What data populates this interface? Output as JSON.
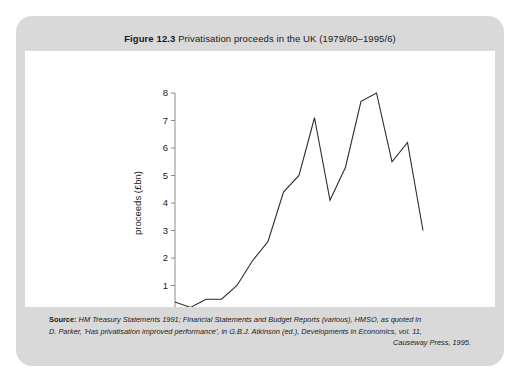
{
  "figure": {
    "label": "Figure 12.3",
    "title": "Privatisation proceeds in the UK (1979/80–1995/6)"
  },
  "caption": {
    "source_label": "Source:",
    "line1": "HM Treasury Statements 1991; Financial Statements and Budget Reports (various), HMSO, as quoted in",
    "line2": "D. Parker, 'Has privatisation improved performance', in G.B.J. Atkinson (ed.), Developments in Economics, vol. 11,",
    "line3": "Causeway Press, 1995."
  },
  "colors": {
    "card_border": "#d9d9d9",
    "band_background": "#d9d9d9",
    "axis": "#8a8a8a",
    "line": "#2b2b2b",
    "text": "#1a1a1a",
    "page_background": "#ffffff"
  },
  "chart_data": {
    "type": "line",
    "title": "Privatisation proceeds in the UK (1979/80–1995/6)",
    "xlabel": "",
    "ylabel": "proceeds (£bn)",
    "xlim": [
      1979,
      1995
    ],
    "ylim": [
      0,
      8
    ],
    "yticks": [
      0,
      1,
      2,
      3,
      4,
      5,
      6,
      7,
      8
    ],
    "ytick_labels": [
      "0",
      "1",
      "2",
      "3",
      "4",
      "5",
      "6",
      "7",
      "8"
    ],
    "xticks": [
      1979,
      1981,
      1983,
      1985,
      1987,
      1989,
      1991,
      1993,
      1995
    ],
    "xtick_labels": [
      "1979",
      "1981",
      "1983",
      "1985",
      "1987",
      "1989",
      "1991",
      "1993",
      "1995"
    ],
    "grid": false,
    "legend": false,
    "x": [
      1979,
      1980,
      1981,
      1982,
      1983,
      1984,
      1985,
      1986,
      1987,
      1988,
      1989,
      1990,
      1991,
      1992,
      1993,
      1994,
      1995
    ],
    "values": [
      0.4,
      0.2,
      0.5,
      0.5,
      1.0,
      1.9,
      2.6,
      4.4,
      5.0,
      7.1,
      4.1,
      5.3,
      7.7,
      8.0,
      5.5,
      6.2,
      3.0
    ],
    "series": [
      {
        "name": "Privatisation proceeds",
        "values": [
          0.4,
          0.2,
          0.5,
          0.5,
          1.0,
          1.9,
          2.6,
          4.4,
          5.0,
          7.1,
          4.1,
          5.3,
          7.7,
          8.0,
          5.5,
          6.2,
          3.0
        ]
      }
    ]
  }
}
